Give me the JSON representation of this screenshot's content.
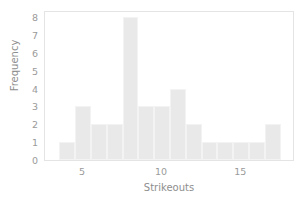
{
  "chart_data": {
    "type": "bar",
    "title": "",
    "xlabel": "Strikeouts",
    "ylabel": "Frequency",
    "xlim": [
      2.6,
      18.4
    ],
    "ylim": [
      0,
      8.4
    ],
    "grid": false,
    "legend": null,
    "bin_width": 1,
    "bin_starts": [
      3.5,
      4.5,
      5.5,
      6.5,
      7.5,
      8.5,
      9.5,
      10.5,
      11.5,
      12.5,
      13.5,
      14.5,
      15.5,
      16.5
    ],
    "bin_centers": [
      4,
      5,
      6,
      7,
      8,
      9,
      10,
      11,
      12,
      13,
      14,
      15,
      16,
      17
    ],
    "categories": [
      "4",
      "5",
      "6",
      "7",
      "8",
      "9",
      "10",
      "11",
      "12",
      "13",
      "14",
      "15",
      "16",
      "17"
    ],
    "values": [
      1,
      3,
      2,
      2,
      8,
      3,
      3,
      4,
      2,
      1,
      1,
      1,
      1,
      2
    ],
    "xticks": [
      5,
      10,
      15
    ],
    "xticklabels": [
      "5",
      "10",
      "15"
    ],
    "yticks": [
      0,
      1,
      2,
      3,
      4,
      5,
      6,
      7,
      8
    ],
    "yticklabels": [
      "0",
      "1",
      "2",
      "3",
      "4",
      "5",
      "6",
      "7",
      "8"
    ],
    "bar_color": "#e9e9e9",
    "bar_edge_color": "#f3f3f3",
    "text_color": "#9a9a9a",
    "frame_color": "#e4e4e4",
    "background_color": "#ffffff"
  }
}
